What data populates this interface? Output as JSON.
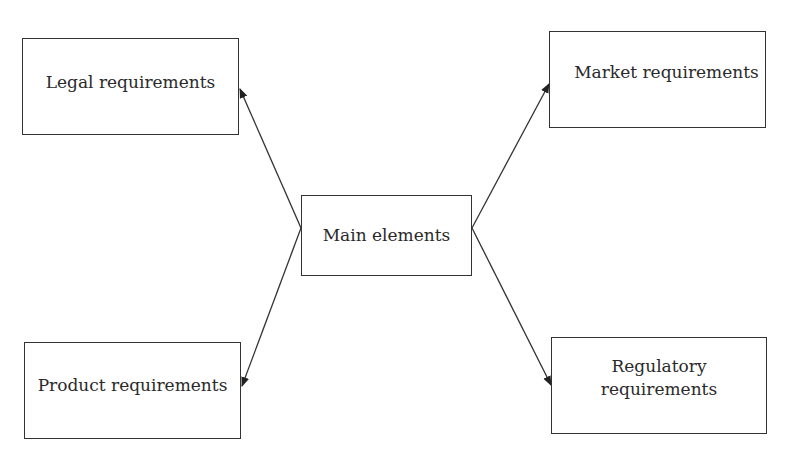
{
  "diagram": {
    "type": "hub-and-spoke",
    "center": {
      "label": "Main elements"
    },
    "nodes": [
      {
        "id": "legal",
        "label": "Legal requirements",
        "position": "top-left"
      },
      {
        "id": "market",
        "label": "Market requirements",
        "position": "top-right"
      },
      {
        "id": "product",
        "label": "Product requirements",
        "position": "bottom-left"
      },
      {
        "id": "regulatory",
        "label": "Regulatory\nrequirements",
        "position": "bottom-right"
      }
    ],
    "edges": [
      {
        "from": "Main elements",
        "to": "Legal requirements"
      },
      {
        "from": "Main elements",
        "to": "Market requirements"
      },
      {
        "from": "Main elements",
        "to": "Product requirements"
      },
      {
        "from": "Main elements",
        "to": "Regulatory requirements"
      }
    ],
    "colors": {
      "stroke": "#333333",
      "text": "#2a2a2a",
      "background": "#ffffff"
    }
  }
}
